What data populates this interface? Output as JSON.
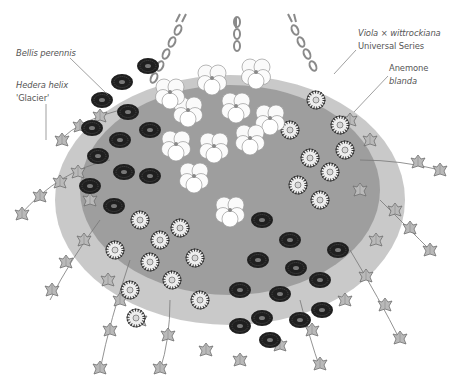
{
  "figure": {
    "palette": {
      "ink": "#1e1e1e",
      "mid": "#7a7a7a",
      "light": "#cfcfcf",
      "label": "#555555",
      "background": "#ffffff"
    }
  },
  "labels": [
    {
      "id": "bellis",
      "line1": "Bellis perennis",
      "line2": ""
    },
    {
      "id": "hedera",
      "line1": "Hedera helix",
      "line2": "'Glacier'"
    },
    {
      "id": "viola",
      "line1": "Viola × wittrockiana",
      "line2": "Universal Series"
    },
    {
      "id": "anemone",
      "line1": "Anemone",
      "line2": "blanda"
    }
  ]
}
